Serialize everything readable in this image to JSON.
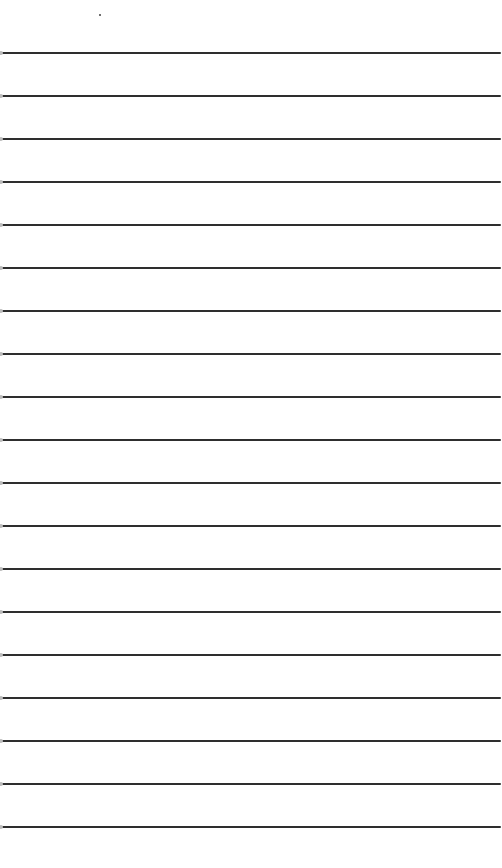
{
  "document": {
    "type": "lined-paper",
    "background_color": "#ffffff",
    "line_color": "#2e2e2e",
    "line_count": 19,
    "first_line_y": 52,
    "line_spacing": 43,
    "lines": [
      {
        "y": 52
      },
      {
        "y": 95
      },
      {
        "y": 138
      },
      {
        "y": 181
      },
      {
        "y": 224
      },
      {
        "y": 267
      },
      {
        "y": 310
      },
      {
        "y": 353
      },
      {
        "y": 396
      },
      {
        "y": 439
      },
      {
        "y": 482
      },
      {
        "y": 525
      },
      {
        "y": 568
      },
      {
        "y": 611
      },
      {
        "y": 654
      },
      {
        "y": 697
      },
      {
        "y": 740
      },
      {
        "y": 783
      },
      {
        "y": 826
      }
    ],
    "text": ""
  }
}
